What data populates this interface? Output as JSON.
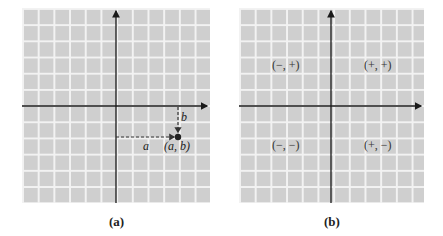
{
  "panels": [
    {
      "id": "a",
      "caption": "(a)",
      "labels": {
        "horizontal_distance": "a",
        "vertical_distance": "b",
        "point": "(a, b)"
      },
      "point": {
        "grid_x": 4,
        "grid_y": -2
      }
    },
    {
      "id": "b",
      "caption": "(b)",
      "quadrants": {
        "q2": "(−, +)",
        "q1": "(+, +)",
        "q3": "(−, −)",
        "q4": "(+, −)"
      }
    }
  ],
  "colors": {
    "grid_background": "#cfcfcf",
    "grid_lines": "#f2f2f2",
    "axes": "#1a1a1a",
    "dashed": "#333333",
    "point": "#222222"
  }
}
